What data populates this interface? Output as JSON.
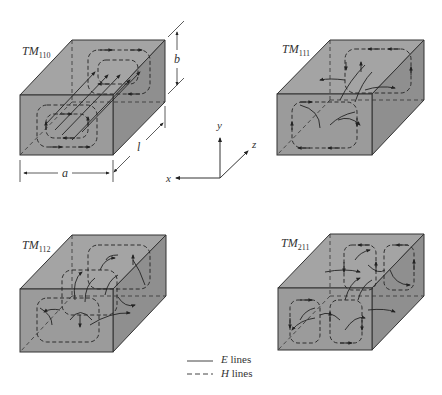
{
  "figure": {
    "colors": {
      "face": "#9a9a9a",
      "face_top": "#a6a6a6",
      "face_side": "#8e8e8e",
      "edge": "#333333",
      "line": "#222222"
    }
  },
  "boxes": [
    {
      "mode_prefix": "TM",
      "mode_index": "110",
      "position": "top-left"
    },
    {
      "mode_prefix": "TM",
      "mode_index": "111",
      "position": "top-right"
    },
    {
      "mode_prefix": "TM",
      "mode_index": "112",
      "position": "bottom-left"
    },
    {
      "mode_prefix": "TM",
      "mode_index": "211",
      "position": "bottom-right"
    }
  ],
  "dimensions": {
    "width_label": "a",
    "height_label": "b",
    "length_label": "l"
  },
  "axes": {
    "x": "x",
    "y": "y",
    "z": "z"
  },
  "legend": [
    {
      "style": "solid",
      "symbol": "E",
      "text": "lines"
    },
    {
      "style": "dashed",
      "symbol": "H",
      "text": "lines"
    }
  ]
}
